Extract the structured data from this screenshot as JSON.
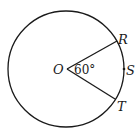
{
  "diagram": {
    "type": "circle-central-angle",
    "center_label": "O",
    "points": [
      {
        "label": "R",
        "position": "on circle, upper right"
      },
      {
        "label": "S",
        "position": "on circle, right, on arc RT"
      },
      {
        "label": "T",
        "position": "on circle, lower right"
      }
    ],
    "angle": {
      "vertex": "O",
      "between": [
        "R",
        "T"
      ],
      "label": "60°"
    },
    "segments": [
      "OR",
      "OT"
    ],
    "stroke_color": "#1a1a1a",
    "background": "#ffffff"
  },
  "labels": {
    "O": "O",
    "R": "R",
    "S": "S",
    "T": "T",
    "angle": "60°"
  }
}
